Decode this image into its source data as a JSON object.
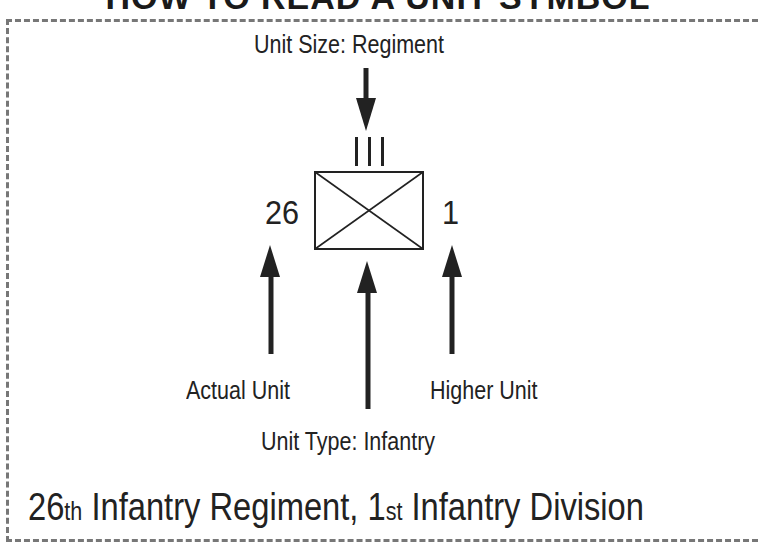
{
  "title": "HOW TO READ A UNIT SYMBOL",
  "labels": {
    "unit_size": "Unit Size: Regiment",
    "actual_unit": "Actual Unit",
    "higher_unit": "Higher Unit",
    "unit_type": "Unit Type: Infantry"
  },
  "symbol": {
    "size_indicator": "III",
    "left_number": "26",
    "right_number": "1",
    "type": "infantry-cross"
  },
  "caption": {
    "unit_num": "26",
    "unit_suffix": "th",
    "unit_text": " Infantry Regiment, ",
    "higher_num": "1",
    "higher_suffix": "st",
    "higher_text": " Infantry Division"
  },
  "colors": {
    "ink": "#222222",
    "border": "#777777",
    "background": "#ffffff"
  }
}
